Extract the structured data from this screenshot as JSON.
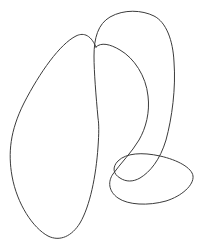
{
  "canvas": {
    "width": 209,
    "height": 244,
    "background_color": "#ffffff",
    "title": "Hand-drawn looping doodle"
  },
  "drawing": {
    "type": "freehand-sketch",
    "description": "Continuous single-stroke closed curve forming three overlapping lobes",
    "stroke_color": "#3b3b3b",
    "stroke_width": 1,
    "fill": "none",
    "lobes": [
      {
        "name": "left-tilted-ellipse",
        "bounds": {
          "x_min": 10,
          "y_min": 35,
          "x_max": 99,
          "y_max": 240
        },
        "extrema": {
          "top": [
            78,
            35
          ],
          "left": [
            10,
            141
          ],
          "bottom": [
            52,
            238
          ],
          "right": [
            99,
            119
          ]
        }
      },
      {
        "name": "right-tall-loop",
        "bounds": {
          "x_min": 94,
          "y_min": 12,
          "x_max": 175,
          "y_max": 180
        },
        "extrema": {
          "top": [
            140,
            12
          ],
          "left": [
            95,
            50
          ],
          "right": [
            174,
            66
          ],
          "bottom": [
            133,
            178
          ]
        }
      },
      {
        "name": "bottom-right-flat-loop",
        "bounds": {
          "x_min": 112,
          "y_min": 154,
          "x_max": 194,
          "y_max": 205
        },
        "extrema": {
          "top": [
            150,
            155
          ],
          "left": [
            113,
            181
          ],
          "right": [
            193,
            176
          ],
          "bottom": [
            150,
            204
          ]
        }
      }
    ],
    "crossings": [
      {
        "name": "upper-crossing",
        "x": 96,
        "y": 47
      },
      {
        "name": "middle-crossing",
        "x": 98,
        "y": 119
      },
      {
        "name": "lower-loop-crossing",
        "x": 139,
        "y": 168
      }
    ],
    "path_d": "M 96 47 C 90 33 82 33 76 36 C 60 44 40 72 24 103 C 10 131 8 153 12 176 C 17 204 33 228 48 236 C 60 242 72 236 80 223 C 90 206 96 176 98 147 C 99 133 99 124 98 118 C 96 96 94 72 94 56 C 94 38 98 24 110 17 C 124 9 142 10 154 16 C 166 22 173 40 174 62 C 176 88 172 118 166 140 C 160 160 150 172 140 178 C 133 182 126 182 120 178 C 113 174 112 167 118 161 C 126 153 142 152 160 156 C 178 160 192 168 193 176 C 194 185 182 196 166 201 C 148 206 128 205 118 198 C 108 191 108 181 113 174 C 120 164 132 152 139 140 C 146 128 150 112 148 96 C 146 76 134 58 120 50 C 110 44 101 42 96 47 Z"
  }
}
